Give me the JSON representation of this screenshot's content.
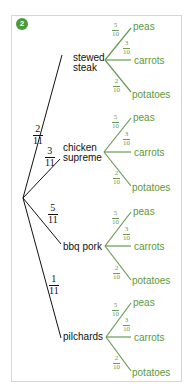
{
  "badge": {
    "label": "2",
    "color": "#4c9a3a"
  },
  "colors": {
    "main_branch": "#111111",
    "sub_branch": "#6a9a55",
    "leaf_text": "#5a9a3c",
    "frame": "#d6d6d6"
  },
  "tree": {
    "root": {
      "x": 23,
      "y": 198
    },
    "branches": [
      {
        "label_lines": [
          "stewed",
          "steak"
        ],
        "prob": {
          "n": "2",
          "d": "11"
        },
        "node": {
          "x": 74,
          "y": 60
        },
        "outcomes": [
          {
            "label": "peas",
            "prob": {
              "n": "5",
              "d": "10"
            }
          },
          {
            "label": "carrots",
            "prob": {
              "n": "3",
              "d": "10"
            }
          },
          {
            "label": "potatoes",
            "prob": {
              "n": "2",
              "d": "10"
            }
          }
        ]
      },
      {
        "label_lines": [
          "chicken",
          "supreme"
        ],
        "prob": {
          "n": "3",
          "d": "11"
        },
        "node": {
          "x": 60,
          "y": 156
        },
        "outcomes": [
          {
            "label": "peas",
            "prob": {
              "n": "5",
              "d": "10"
            }
          },
          {
            "label": "carrots",
            "prob": {
              "n": "3",
              "d": "10"
            }
          },
          {
            "label": "potatoes",
            "prob": {
              "n": "2",
              "d": "10"
            }
          }
        ]
      },
      {
        "label_lines": [
          "bbq pork"
        ],
        "prob": {
          "n": "5",
          "d": "11"
        },
        "node": {
          "x": 60,
          "y": 243
        },
        "outcomes": [
          {
            "label": "peas",
            "prob": {
              "n": "5",
              "d": "10"
            }
          },
          {
            "label": "carrots",
            "prob": {
              "n": "3",
              "d": "10"
            }
          },
          {
            "label": "potatoes",
            "prob": {
              "n": "2",
              "d": "10"
            }
          }
        ]
      },
      {
        "label_lines": [
          "pilchards"
        ],
        "prob": {
          "n": "1",
          "d": "11"
        },
        "node": {
          "x": 60,
          "y": 336
        },
        "outcomes": [
          {
            "label": "peas",
            "prob": {
              "n": "5",
              "d": "10"
            }
          },
          {
            "label": "carrots",
            "prob": {
              "n": "3",
              "d": "10"
            }
          },
          {
            "label": "potatoes",
            "prob": {
              "n": "2",
              "d": "10"
            }
          }
        ]
      }
    ]
  }
}
